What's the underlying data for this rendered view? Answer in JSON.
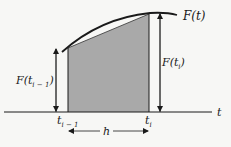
{
  "diagram": {
    "curve_label": "F(t)",
    "left_height_label_main": "F(t",
    "left_height_label_sub": "i − 1",
    "left_height_label_close": ")",
    "right_height_label_main": "F(t",
    "right_height_label_sub": "i",
    "right_height_label_close": ")",
    "axis_label": "t",
    "left_tick_main": "t",
    "left_tick_sub": "i − 1",
    "right_tick_main": "t",
    "right_tick_sub": "i",
    "width_label": "h",
    "colors": {
      "background": "#f7f7f5",
      "shade": "#a9a9a9",
      "line": "#1a1a1a"
    }
  }
}
